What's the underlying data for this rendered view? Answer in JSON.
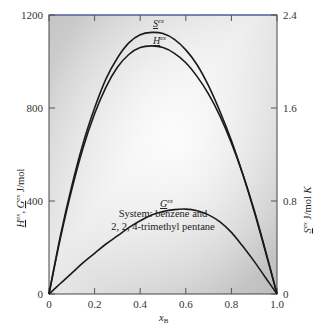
{
  "chart_data": {
    "type": "line",
    "title": "",
    "annotation": [
      "System: benzene and",
      "2, 2, 4-trimethyl pentane"
    ],
    "xlabel": "x_B",
    "xlabel_main": "x",
    "xlabel_sub": "B",
    "ylabel_left": "H^ex, G^ex J/mol",
    "ylabel_right": "S^ex J/mol K",
    "xlim": [
      0,
      1.0
    ],
    "ylim_left": [
      0,
      1200
    ],
    "ylim_right": [
      0,
      2.4
    ],
    "x_ticks": [
      "0",
      "0.2",
      "0.4",
      "0.6",
      "0.8",
      "1.0"
    ],
    "y_ticks_left": [
      "0",
      "400",
      "800",
      "1200"
    ],
    "y_ticks_right": [
      "0",
      "0.8",
      "1.6",
      "2.4"
    ],
    "grid": false,
    "legend": "inline labels on curves",
    "x": [
      0,
      0.05,
      0.1,
      0.15,
      0.2,
      0.25,
      0.3,
      0.35,
      0.4,
      0.45,
      0.5,
      0.55,
      0.6,
      0.65,
      0.7,
      0.75,
      0.8,
      0.85,
      0.9,
      0.95,
      1.0
    ],
    "series": [
      {
        "name": "S^ex",
        "axis": "right",
        "label": "S",
        "label_sup": "ex",
        "values": [
          0,
          0.5,
          0.93,
          1.3,
          1.6,
          1.85,
          2.03,
          2.16,
          2.23,
          2.25,
          2.24,
          2.19,
          2.1,
          1.97,
          1.79,
          1.57,
          1.32,
          1.03,
          0.71,
          0.36,
          0
        ]
      },
      {
        "name": "H^ex",
        "axis": "left",
        "label": "H",
        "label_sup": "ex",
        "values": [
          0,
          240,
          450,
          630,
          775,
          890,
          975,
          1030,
          1060,
          1067,
          1060,
          1035,
          995,
          935,
          860,
          765,
          650,
          515,
          360,
          185,
          0
        ]
      },
      {
        "name": "G^ex",
        "axis": "left",
        "label": "G",
        "label_sup": "ex",
        "values": [
          0,
          45,
          90,
          135,
          175,
          215,
          250,
          285,
          315,
          340,
          355,
          363,
          365,
          358,
          340,
          310,
          265,
          205,
          140,
          70,
          0
        ]
      }
    ]
  },
  "colors": {
    "curve": "#1a1a1a",
    "frame": "#444444",
    "top_border": "#4a5bd0",
    "bg_dark": "#c9c9c9",
    "bg_light": "#fbfbfb"
  }
}
